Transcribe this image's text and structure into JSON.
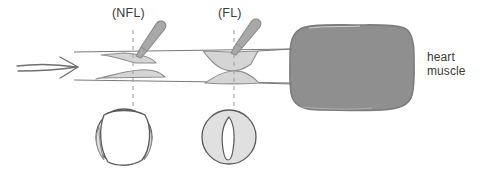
{
  "figure": {
    "type": "medical-anatomical-diagram",
    "background_color": "#ffffff"
  },
  "labels": {
    "nfl": "(NFL)",
    "fl": "(FL)",
    "heart_muscle_line1": "heart",
    "heart_muscle_line2": "muscle"
  },
  "colors": {
    "ink": "#4a4a4a",
    "ink_light": "#8d8d8d",
    "text": "#3a3a3a",
    "plaque_fill": "#d5d5d5",
    "plaque_stroke": "#8d8d8d",
    "muscle_fill": "#8f8f8f",
    "muscle_stroke": "#7d7d7d",
    "probe_fill": "#a8a8a8",
    "probe_stroke": "#8a8a8a",
    "lumen_fill": "#ffffff",
    "dash": "#a0a0a0"
  },
  "elements": {
    "flow_arrow_name": "blood-flow-arrow",
    "vessel_name": "artery-longitudinal-section",
    "muscle_name": "heart-muscle-blob",
    "probe_nfl_name": "probe-nfl",
    "probe_fl_name": "probe-fl",
    "xsec_nfl_name": "cross-section-nfl",
    "xsec_fl_name": "cross-section-fl"
  },
  "geometry": {
    "canvas": {
      "width": 484,
      "height": 183
    },
    "vessel": {
      "top_wall_y": 52,
      "bottom_wall_y": 80,
      "x_start": 74,
      "x_end": 300
    },
    "nfl_axis_x": 133,
    "fl_axis_x": 234,
    "cross_section_nfl": {
      "cx": 124,
      "cy": 137,
      "r": 28
    },
    "cross_section_fl": {
      "cx": 229,
      "cy": 137,
      "r": 27
    },
    "muscle_box": {
      "x": 291,
      "y": 25,
      "width": 124,
      "height": 85
    }
  }
}
